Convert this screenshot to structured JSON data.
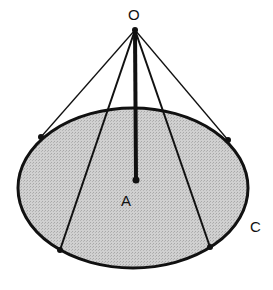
{
  "diagram": {
    "labels": {
      "apex": "O",
      "center": "A",
      "circle": "C"
    },
    "colors": {
      "fill": "#c8c8c8",
      "stroke": "#111111",
      "background": "#ffffff"
    }
  }
}
